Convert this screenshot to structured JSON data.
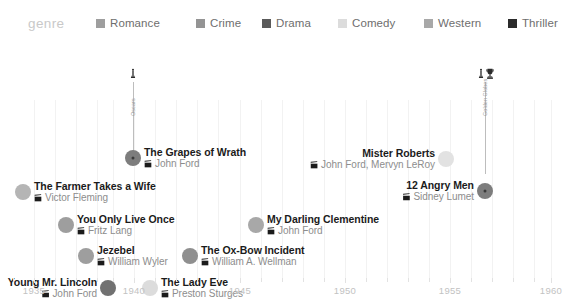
{
  "legend": {
    "title": "genre",
    "items": [
      {
        "label": "Romance",
        "color": "#9e9e9e",
        "x": 96
      },
      {
        "label": "Crime",
        "color": "#949494",
        "x": 196
      },
      {
        "label": "Drama",
        "color": "#5a5a5a",
        "x": 262
      },
      {
        "label": "Comedy",
        "color": "#dcdcdc",
        "x": 338
      },
      {
        "label": "Western",
        "color": "#a8a8a8",
        "x": 424
      },
      {
        "label": "Thriller",
        "color": "#2b2b2b",
        "x": 508
      }
    ]
  },
  "axis": {
    "label": "",
    "ticks": [
      {
        "value": "1935",
        "x": 34
      },
      {
        "value": "1940",
        "x": 134
      },
      {
        "value": "1945",
        "x": 240
      },
      {
        "value": "1950",
        "x": 345
      },
      {
        "value": "1955",
        "x": 450
      },
      {
        "value": "1960",
        "x": 551
      }
    ],
    "minor_ticks_x": [
      13,
      55,
      76,
      97,
      113,
      155,
      176,
      197,
      218,
      261,
      282,
      303,
      324,
      366,
      387,
      408,
      429,
      471,
      492,
      513,
      534
    ],
    "gridlines_x": [
      34,
      55,
      76,
      97,
      113,
      134,
      155,
      176,
      197,
      218,
      240,
      261,
      282,
      303,
      324,
      345,
      366,
      387,
      408,
      429,
      450,
      471,
      492,
      513,
      534,
      551
    ],
    "range": [
      1934,
      1960
    ]
  },
  "awards": {
    "stems": [
      {
        "name": "grapes-of-wrath-award-stem",
        "x": 133,
        "top": 44,
        "height": 74,
        "rot_label": "Oscars",
        "icons": [
          "oscar-statuette-icon"
        ]
      },
      {
        "name": "twelve-angry-men-award-stem",
        "x": 485,
        "top": 44,
        "height": 92,
        "rot_label": "Golden Globes",
        "icons": [
          "oscar-statuette-icon",
          "trophy-icon"
        ]
      }
    ]
  },
  "chart_data": {
    "type": "scatter",
    "title": "",
    "xlabel": "",
    "ylabel": "",
    "xlim": [
      1934,
      1960
    ],
    "grid": true,
    "legend_position": "top",
    "legend_title": "genre",
    "films": [
      {
        "title": "The Grapes of Wrath",
        "director": "John Ford",
        "year": 1940,
        "genre": "Drama",
        "color": "#7d7d7d",
        "radius": 8,
        "has_center_dot": true,
        "x": 133,
        "y": 120,
        "label_side": "right",
        "label_x": 144
      },
      {
        "title": "The Farmer Takes a Wife",
        "director": "Victor Fleming",
        "year": 1935,
        "genre": "Comedy",
        "color": "#b5b5b5",
        "radius": 8,
        "has_center_dot": false,
        "x": 23,
        "y": 154,
        "label_side": "right",
        "label_x": 34
      },
      {
        "title": "You Only Live Once",
        "director": "Fritz Lang",
        "year": 1937,
        "genre": "Crime",
        "color": "#9e9e9e",
        "radius": 8,
        "has_center_dot": false,
        "x": 66,
        "y": 187,
        "label_side": "right",
        "label_x": 77
      },
      {
        "title": "My Darling Clementine",
        "director": "John Ford",
        "year": 1946,
        "genre": "Western",
        "color": "#a8a8a8",
        "radius": 8,
        "has_center_dot": false,
        "x": 256,
        "y": 187,
        "label_side": "right",
        "label_x": 267
      },
      {
        "title": "Jezebel",
        "director": "William Wyler",
        "year": 1938,
        "genre": "Romance",
        "color": "#9e9e9e",
        "radius": 8,
        "has_center_dot": false,
        "x": 86,
        "y": 218,
        "label_side": "right",
        "label_x": 97
      },
      {
        "title": "The Ox-Bow Incident",
        "director": "William A. Wellman",
        "year": 1943,
        "genre": "Western",
        "color": "#8f8f8f",
        "radius": 8,
        "has_center_dot": false,
        "x": 190,
        "y": 218,
        "label_side": "right",
        "label_x": 201
      },
      {
        "title": "Young Mr. Lincoln",
        "director": "John Ford",
        "year": 1939,
        "genre": "Drama",
        "color": "#717171",
        "radius": 8,
        "has_center_dot": false,
        "x": 108,
        "y": 250,
        "label_side": "left",
        "label_x": 97
      },
      {
        "title": "The Lady Eve",
        "director": "Preston Sturges",
        "year": 1941,
        "genre": "Comedy",
        "color": "#dcdcdc",
        "radius": 8,
        "has_center_dot": false,
        "x": 150,
        "y": 250,
        "label_side": "right",
        "label_x": 161
      },
      {
        "title": "Mister Roberts",
        "director": "John Ford, Mervyn LeRoy",
        "year": 1955,
        "genre": "Comedy",
        "color": "#e2e2e2",
        "radius": 8,
        "has_center_dot": false,
        "x": 446,
        "y": 121,
        "label_side": "left",
        "label_x": 435
      },
      {
        "title": "12 Angry Men",
        "director": "Sidney Lumet",
        "year": 1957,
        "genre": "Drama",
        "color": "#7d7d7d",
        "radius": 8,
        "has_center_dot": true,
        "x": 485,
        "y": 153,
        "label_side": "left",
        "label_x": 474
      }
    ]
  }
}
